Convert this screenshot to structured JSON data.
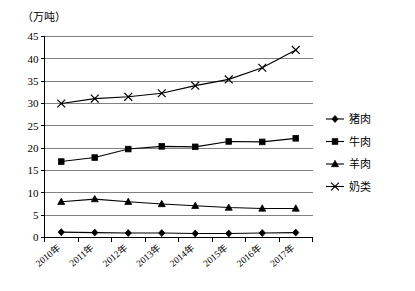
{
  "chart_data": {
    "type": "line",
    "title": "",
    "subtitle": "",
    "unit_label": "（万吨）",
    "xlabel": "",
    "ylabel": "",
    "ylim": [
      0,
      45
    ],
    "ytick_step": 5,
    "yticks": [
      "0",
      "5",
      "10",
      "15",
      "20",
      "25",
      "30",
      "35",
      "40",
      "45"
    ],
    "grid": true,
    "legend_position": "right",
    "categories": [
      "2010年",
      "2011年",
      "2012年",
      "2013年",
      "2014年",
      "2015年",
      "2016年",
      "2017年"
    ],
    "series": [
      {
        "name": "猪肉",
        "marker": "diamond",
        "values": [
          1.2,
          1.1,
          1.0,
          1.0,
          0.9,
          0.9,
          1.0,
          1.1
        ]
      },
      {
        "name": "牛肉",
        "marker": "square",
        "values": [
          17.0,
          17.9,
          19.8,
          20.4,
          20.3,
          21.5,
          21.4,
          22.2
        ]
      },
      {
        "name": "羊肉",
        "marker": "triangle",
        "values": [
          8.0,
          8.6,
          8.0,
          7.5,
          7.1,
          6.7,
          6.5,
          6.5
        ]
      },
      {
        "name": "奶类",
        "marker": "cross-x",
        "values": [
          30.0,
          31.1,
          31.5,
          32.3,
          34.0,
          35.4,
          38.0,
          42.0
        ]
      }
    ],
    "colors": {
      "line": "#000000",
      "grid": "#808080",
      "axis": "#000000",
      "background": "#ffffff"
    }
  }
}
